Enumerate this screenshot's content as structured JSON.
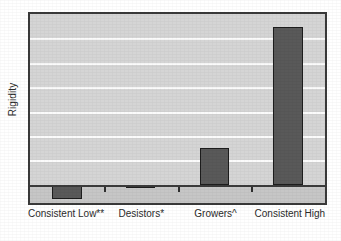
{
  "chart_data": {
    "type": "bar",
    "title": "",
    "xlabel": "",
    "ylabel": "Rigidity",
    "categories": [
      "Consistent Low**",
      "Desistors*",
      "Growers^",
      "Consistent High"
    ],
    "values": [
      -0.087,
      -0.019,
      0.23,
      1.0
    ],
    "series": [
      {
        "name": "Rigidity",
        "values": [
          -0.087,
          -0.019,
          0.23,
          1.0
        ]
      }
    ],
    "ylim": [
      -0.115,
      1.08
    ],
    "grid": true,
    "gridline_count": 6,
    "gridline_color": "#fbfbfb",
    "legend": "none",
    "bar_color": "#595959",
    "bar_edge_color": "#1d1d1d",
    "plot_background": "#d5d5d5",
    "plot_background_below_zero": "#c6c6c6",
    "frame_color": "#3a3a3a",
    "zero_line_color": "#3b3b3b",
    "tick_marks": true,
    "axis_tick_labels": []
  },
  "axes": {
    "y_title": "Rigidity"
  }
}
